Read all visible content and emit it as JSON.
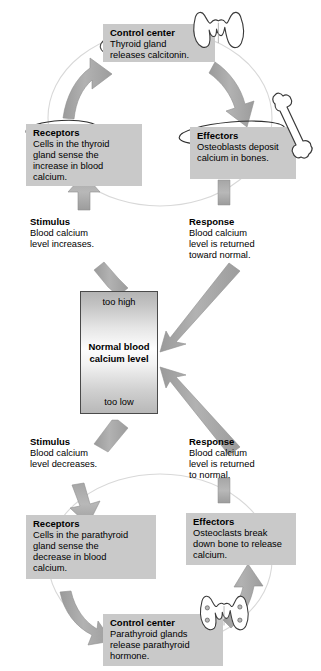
{
  "diagram": {
    "colors": {
      "box_fill": "#c9c9c9",
      "arrow_fill": "#a8a8a8",
      "arrow_shadow": "#8f8f8f",
      "text": "#000000",
      "background": "#ffffff",
      "center_border": "#4a4a4a"
    }
  },
  "upper_loop": {
    "control_center": {
      "header": "Control center",
      "body": "Thyroid gland\nreleases calcitonin.",
      "icon": "thyroid-gland-icon",
      "circled": true
    },
    "receptors": {
      "header": "Receptors",
      "body": "Cells in the thyroid\ngland sense the\nincrease in blood\ncalcium.",
      "circled": true
    },
    "effectors": {
      "header": "Effectors",
      "body": "Osteoblasts deposit\ncalcium in bones.",
      "icon": "long-bone-icon",
      "circled": true
    },
    "stimulus": {
      "header": "Stimulus",
      "body": "Blood calcium\nlevel increases."
    },
    "response": {
      "header": "Response",
      "body": "Blood calcium\nlevel is returned\ntoward normal."
    }
  },
  "center": {
    "too_high_label": "too high",
    "normal_label": "Normal blood\ncalcium level",
    "too_low_label": "too low"
  },
  "lower_loop": {
    "stimulus": {
      "header": "Stimulus",
      "body": "Blood calcium\nlevel decreases."
    },
    "response": {
      "header": "Response",
      "body": "Blood calcium\nlevel is returned\nto normal."
    },
    "receptors": {
      "header": "Receptors",
      "body": "Cells in the parathyroid\ngland sense the\ndecrease in blood\ncalcium.",
      "circled": false
    },
    "effectors": {
      "header": "Effectors",
      "body": "Osteoclasts break\ndown bone to release\ncalcium.",
      "circled": false
    },
    "control_center": {
      "header": "Control center",
      "body": "Parathyroid glands\nrelease parathyroid\nhormone.",
      "icon": "parathyroid-glands-icon",
      "circled": false
    }
  }
}
